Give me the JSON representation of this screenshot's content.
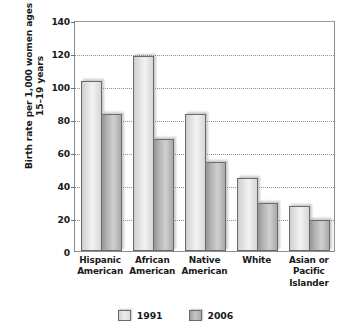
{
  "chart_data": {
    "type": "bar",
    "title": "",
    "xlabel": "",
    "ylabel": "Birth rate per 1,000 women ages 15–19 years",
    "ylabel_lines": [
      "Birth rate per 1,000 women ages",
      "15–19 years"
    ],
    "ylim": [
      0,
      140
    ],
    "ytick_step": 20,
    "yticks": [
      0,
      20,
      40,
      60,
      80,
      100,
      120,
      140
    ],
    "ytick_labels": [
      "0",
      "20",
      "40",
      "60",
      "80",
      "100",
      "120",
      "140"
    ],
    "grid": true,
    "grid_axis": "y",
    "legend_position": "bottom",
    "categories": [
      "Hispanic American",
      "African American",
      "Native American",
      "White",
      "Asian or Pacific Islander"
    ],
    "category_label_lines": [
      [
        "Hispanic",
        "American"
      ],
      [
        "African",
        "American"
      ],
      [
        "Native",
        "American"
      ],
      [
        "White"
      ],
      [
        "Asian or",
        "Pacific",
        "Islander"
      ]
    ],
    "series": [
      {
        "name": "1991",
        "color": "#ededed",
        "values": [
          103,
          118,
          83,
          44,
          27
        ]
      },
      {
        "name": "2006",
        "color": "#b9b9b9",
        "values": [
          83,
          68,
          54,
          29,
          19
        ]
      }
    ]
  },
  "legend": {
    "items": [
      {
        "label": "1991"
      },
      {
        "label": "2006"
      }
    ]
  }
}
